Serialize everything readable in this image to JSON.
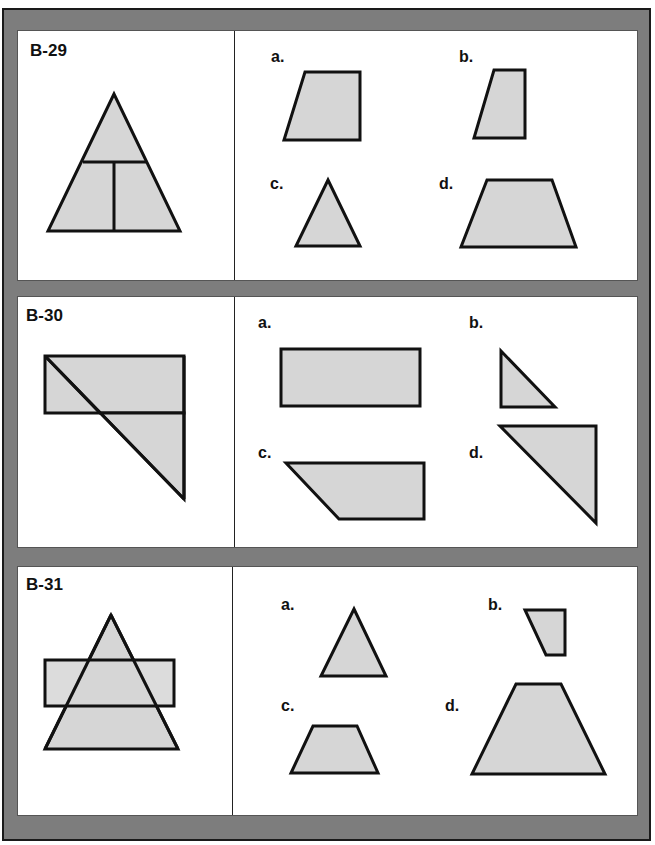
{
  "colors": {
    "frame": "#7d7d7d",
    "panel": "#ffffff",
    "shape_fill": "#d6d6d6",
    "stroke": "#111111"
  },
  "problems": [
    {
      "id": "B-29",
      "options": [
        {
          "label": "a.",
          "shape": "right-trapezoid"
        },
        {
          "label": "b.",
          "shape": "narrow-right-trapezoid"
        },
        {
          "label": "c.",
          "shape": "triangle"
        },
        {
          "label": "d.",
          "shape": "isosceles-trapezoid"
        }
      ]
    },
    {
      "id": "B-30",
      "options": [
        {
          "label": "a.",
          "shape": "rectangle"
        },
        {
          "label": "b.",
          "shape": "small-right-triangle"
        },
        {
          "label": "c.",
          "shape": "right-trapezoid"
        },
        {
          "label": "d.",
          "shape": "large-right-triangle"
        }
      ]
    },
    {
      "id": "B-31",
      "options": [
        {
          "label": "a.",
          "shape": "triangle"
        },
        {
          "label": "b.",
          "shape": "small-right-trapezoid"
        },
        {
          "label": "c.",
          "shape": "isosceles-trapezoid"
        },
        {
          "label": "d.",
          "shape": "large-isosceles-trapezoid"
        }
      ]
    }
  ]
}
